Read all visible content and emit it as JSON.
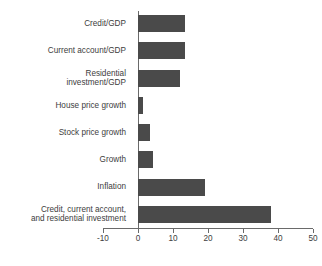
{
  "chart_data": {
    "type": "bar",
    "orientation": "horizontal",
    "title": "",
    "subtitle": "",
    "xlabel": "",
    "ylabel": "",
    "xlim": [
      -10,
      50
    ],
    "xticks": [
      -10,
      0,
      10,
      20,
      30,
      40,
      50
    ],
    "xtick_labels": [
      "-10",
      "0",
      "10",
      "20",
      "30",
      "40",
      "50"
    ],
    "grid": false,
    "legend": false,
    "bar_color": "#4a4a4a",
    "axis_color": "#6a6a6a",
    "text_color": "#3d3d3d",
    "background": "#ffffff",
    "categories": [
      "Credit/GDP",
      "Current account/GDP",
      "Residential\ninvestment/GDP",
      "House price growth",
      "Stock price growth",
      "Growth",
      "Inflation",
      "Credit, current account,\nand residential investment"
    ],
    "values": [
      13.5,
      13.5,
      12,
      1.4,
      3.4,
      4.2,
      19,
      38
    ]
  }
}
